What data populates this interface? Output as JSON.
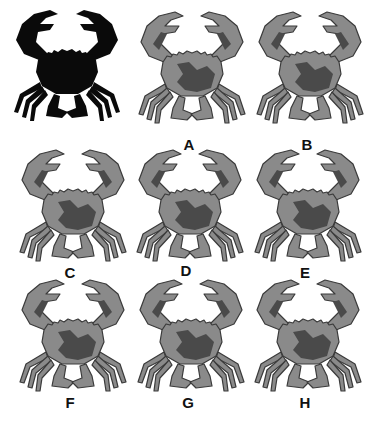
{
  "puzzle": {
    "type": "odd-one-out / find the matching silhouette",
    "reference": {
      "name": "silhouette",
      "color": "#0a0a0a"
    },
    "options": [
      {
        "label": "A"
      },
      {
        "label": "B"
      },
      {
        "label": "C"
      },
      {
        "label": "D"
      },
      {
        "label": "E"
      },
      {
        "label": "F"
      },
      {
        "label": "G"
      },
      {
        "label": "H"
      }
    ]
  },
  "colors": {
    "background": "#ffffff",
    "crab_shell": "#8a8a8a",
    "crab_dark": "#4a4a4a",
    "crab_outline": "#3a3a3a",
    "silhouette": "#0a0a0a",
    "label": "#111111"
  }
}
